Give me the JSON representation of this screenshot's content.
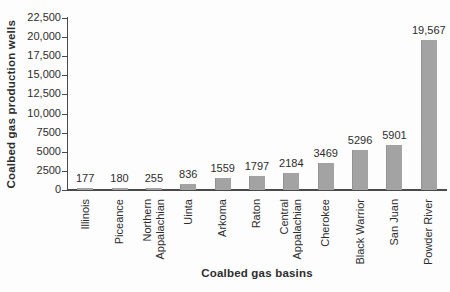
{
  "chart_data": {
    "type": "bar",
    "title": "",
    "xlabel": "Coalbed gas basins",
    "ylabel": "Coalbed gas production wells",
    "ylim": [
      0,
      22500
    ],
    "grid": false,
    "legend": false,
    "bar_color": "#a3a3a3",
    "axis_color": "#4a4a4a",
    "text_color": "#2d2d2d",
    "background_color": "#fdfdfd",
    "y_ticks": [
      {
        "value": 22500,
        "label": "22,500"
      },
      {
        "value": 20000,
        "label": "20,000"
      },
      {
        "value": 17500,
        "label": "17,500"
      },
      {
        "value": 15000,
        "label": "15,000"
      },
      {
        "value": 12500,
        "label": "12,500"
      },
      {
        "value": 10000,
        "label": "10,000"
      },
      {
        "value": 7500,
        "label": "7500"
      },
      {
        "value": 5000,
        "label": "5000"
      },
      {
        "value": 2500,
        "label": "2500"
      },
      {
        "value": 0,
        "label": "0"
      }
    ],
    "categories": [
      "Illinois",
      "Piceance",
      "Northern Appalachian",
      "Uinta",
      "Arkoma",
      "Raton",
      "Central Appalachian",
      "Cherokee",
      "Black Warrior",
      "San Juan",
      "Powder River"
    ],
    "values": [
      177,
      180,
      255,
      836,
      1559,
      1797,
      2184,
      3469,
      5296,
      5901,
      19567
    ],
    "bars": [
      {
        "category": "Illinois",
        "category_lines": [
          "Illinois"
        ],
        "value": 177,
        "value_label": "177"
      },
      {
        "category": "Piceance",
        "category_lines": [
          "Piceance"
        ],
        "value": 180,
        "value_label": "180"
      },
      {
        "category": "Northern Appalachian",
        "category_lines": [
          "Northern",
          "Appalachian"
        ],
        "value": 255,
        "value_label": "255"
      },
      {
        "category": "Uinta",
        "category_lines": [
          "Uinta"
        ],
        "value": 836,
        "value_label": "836"
      },
      {
        "category": "Arkoma",
        "category_lines": [
          "Arkoma"
        ],
        "value": 1559,
        "value_label": "1559"
      },
      {
        "category": "Raton",
        "category_lines": [
          "Raton"
        ],
        "value": 1797,
        "value_label": "1797"
      },
      {
        "category": "Central Appalachian",
        "category_lines": [
          "Central",
          "Appalachian"
        ],
        "value": 2184,
        "value_label": "2184"
      },
      {
        "category": "Cherokee",
        "category_lines": [
          "Cherokee"
        ],
        "value": 3469,
        "value_label": "3469"
      },
      {
        "category": "Black Warrior",
        "category_lines": [
          "Black Warrior"
        ],
        "value": 5296,
        "value_label": "5296"
      },
      {
        "category": "San Juan",
        "category_lines": [
          "San Juan"
        ],
        "value": 5901,
        "value_label": "5901"
      },
      {
        "category": "Powder River",
        "category_lines": [
          "Powder River"
        ],
        "value": 19567,
        "value_label": "19,567"
      }
    ]
  }
}
